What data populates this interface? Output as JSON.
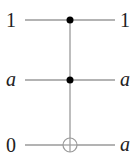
{
  "circuit": {
    "type": "Toffoli gate (CCNOT)",
    "wires": [
      {
        "input": "1",
        "output": "1",
        "input_italic": false,
        "output_italic": false,
        "gate": "control"
      },
      {
        "input": "a",
        "output": "a",
        "input_italic": true,
        "output_italic": true,
        "gate": "control"
      },
      {
        "input": "0",
        "output": "a",
        "input_italic": false,
        "output_italic": true,
        "gate": "target"
      }
    ],
    "colors": {
      "wire": "#9a9a9a",
      "control": "#000000",
      "text": "#222222"
    }
  }
}
